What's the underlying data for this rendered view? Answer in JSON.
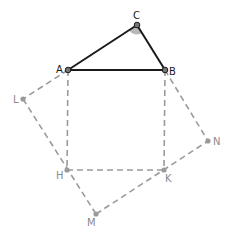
{
  "diagram": {
    "title": "",
    "colors": {
      "solid": "#1a1a1a",
      "dashed": "#9a9a9a",
      "point_solid": "#555555",
      "point_dashed": "#9a9a9a",
      "label_dark": "#1a1a1a",
      "label_light": "#8a8a8a",
      "angle_fill": "#b8b8b8"
    },
    "points": {
      "A": {
        "label": "A",
        "x": 68,
        "y": 70
      },
      "B": {
        "label": "B",
        "x": 165,
        "y": 70
      },
      "C": {
        "label": "C",
        "x": 137,
        "y": 25
      },
      "L": {
        "label": "L",
        "x": 23,
        "y": 99
      },
      "H": {
        "label": "H",
        "x": 67,
        "y": 170
      },
      "K": {
        "label": "K",
        "x": 164,
        "y": 170
      },
      "N": {
        "label": "N",
        "x": 208,
        "y": 141
      },
      "M": {
        "label": "M",
        "x": 96,
        "y": 214
      }
    },
    "triangle": [
      "A",
      "B",
      "C"
    ],
    "square_AB": [
      "A",
      "B",
      "K",
      "H"
    ],
    "square_AM_rotated": [
      "A",
      "L",
      "M",
      "K"
    ],
    "extra_segments": [
      [
        "B",
        "N"
      ],
      [
        "N",
        "K"
      ]
    ],
    "angle_marker": {
      "at": "C",
      "between": [
        "A",
        "B"
      ]
    }
  }
}
